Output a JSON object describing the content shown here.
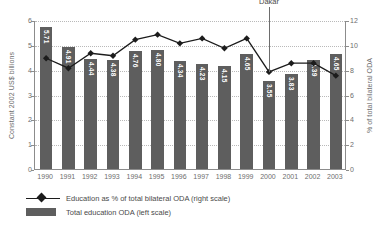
{
  "chart_data": {
    "type": "bar",
    "title": "",
    "subtitle": "",
    "xlabel": "",
    "ylabel": "Constant 2002 US$ billions",
    "y2label": "% of total bilateral ODA",
    "categories": [
      "1990",
      "1991",
      "1992",
      "1993",
      "1994",
      "1995",
      "1996",
      "1997",
      "1998",
      "1999",
      "2000",
      "2001",
      "2002",
      "2003"
    ],
    "ylim": [
      0,
      6
    ],
    "y2lim": [
      0,
      12
    ],
    "yticks": [
      "0",
      "1",
      "2",
      "3",
      "4",
      "5",
      "6"
    ],
    "y2ticks": [
      "0",
      "2",
      "4",
      "6",
      "8",
      "10",
      "12"
    ],
    "grid": true,
    "legend_position": "below",
    "series": [
      {
        "name": "Total education ODA (left scale)",
        "type": "bar",
        "axis": "left",
        "color": "#5e5e5e",
        "values": [
          5.71,
          4.91,
          4.44,
          4.38,
          4.76,
          4.8,
          4.34,
          4.23,
          4.15,
          4.65,
          3.55,
          3.83,
          4.39,
          4.65
        ],
        "labels": [
          "5.71",
          "4.91",
          "4.44",
          "4.38",
          "4.76",
          "4.80",
          "4.34",
          "4.23",
          "4.15",
          "4.65",
          "3.55",
          "3.83",
          "4.39",
          "4.65"
        ]
      },
      {
        "name": "Education as % of total bilateral ODA (right scale)",
        "type": "line",
        "axis": "right",
        "color": "#1c1c1c",
        "values": [
          9.0,
          8.2,
          9.4,
          9.2,
          10.5,
          10.9,
          10.2,
          10.6,
          9.8,
          10.6,
          7.9,
          8.6,
          8.6,
          7.6
        ]
      }
    ],
    "annotations": [
      {
        "label": "Dakar",
        "category": "2000"
      }
    ]
  },
  "legend": {
    "items": [
      {
        "key": "line-marker",
        "label": "Education as % of total bilateral ODA (right scale)"
      },
      {
        "key": "bar-swatch",
        "label": "Total education ODA (left scale)"
      }
    ]
  }
}
